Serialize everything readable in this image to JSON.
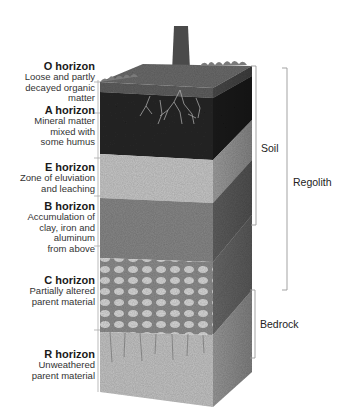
{
  "horizons": [
    {
      "name": "O horizon",
      "desc": [
        "Loose and partly",
        "decayed organic",
        "matter"
      ]
    },
    {
      "name": "A horizon",
      "desc": [
        "Mineral matter",
        "mixed with",
        "some humus"
      ]
    },
    {
      "name": "E horizon",
      "desc": [
        "Zone of eluviation",
        "and leaching"
      ]
    },
    {
      "name": "B horizon",
      "desc": [
        "Accumulation of",
        "clay, iron and",
        "aluminum",
        "from above"
      ]
    },
    {
      "name": "C horizon",
      "desc": [
        "Partially altered",
        "parent material"
      ]
    },
    {
      "name": "R horizon",
      "desc": [
        "Unweathered",
        "parent material"
      ]
    }
  ],
  "brackets": {
    "soil": "Soil",
    "regolith": "Regolith",
    "bedrock": "Bedrock"
  },
  "colors": {
    "o_layer": "#5a5a5a",
    "a_layer": "#2a2a2a",
    "e_layer": "#c8c8c8",
    "b_layer": "#8a8a8a",
    "c_layer": "#9a9a9a",
    "r_layer": "#c4c4c4",
    "bracket_line": "#999999"
  }
}
